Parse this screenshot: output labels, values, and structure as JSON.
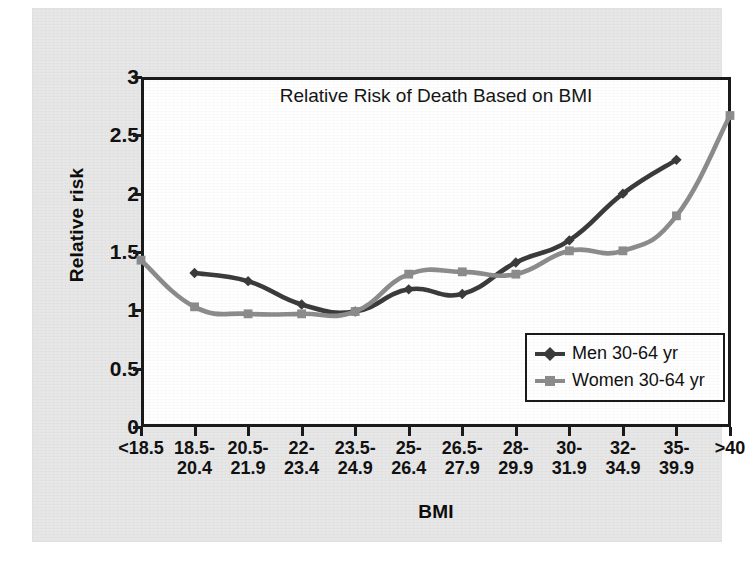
{
  "chart_data": {
    "type": "line",
    "title": "Relative Risk of Death Based on BMI",
    "xlabel": "BMI",
    "ylabel": "Relative risk",
    "categories": [
      "<18.5",
      "18.5-\n20.4",
      "20.5-\n21.9",
      "22-\n23.4",
      "23.5-\n24.9",
      "25-\n26.4",
      "26.5-\n27.9",
      "28-\n29.9",
      "30-\n31.9",
      "32-\n34.9",
      "35-\n39.9",
      ">40"
    ],
    "ylim": [
      0,
      3
    ],
    "yticks": [
      "0",
      "0.5",
      "1",
      "1.5",
      "2",
      "2.5",
      "3"
    ],
    "ytick_values": [
      0,
      0.5,
      1,
      1.5,
      2,
      2.5,
      3
    ],
    "grid": false,
    "legend_position": "lower-right",
    "series": [
      {
        "name": "Men 30-64 yr",
        "color": "#3b3b3b",
        "marker": "diamond",
        "values": [
          null,
          1.32,
          1.25,
          1.05,
          0.99,
          1.18,
          1.14,
          1.41,
          1.6,
          2.0,
          2.29,
          null
        ]
      },
      {
        "name": "Women 30-64 yr",
        "color": "#8c8c8c",
        "marker": "square",
        "values": [
          1.43,
          1.03,
          0.97,
          0.97,
          0.99,
          1.31,
          1.33,
          1.31,
          1.51,
          1.51,
          1.81,
          2.67
        ]
      }
    ]
  },
  "axis": {
    "y_title": "Relative risk",
    "x_title": "BMI"
  },
  "legend": {
    "items": [
      {
        "label": "Men 30-64 yr",
        "color": "#3b3b3b"
      },
      {
        "label": "Women 30-64 yr",
        "color": "#8c8c8c"
      }
    ]
  },
  "colors": {
    "men": "#3b3b3b",
    "women": "#8c8c8c",
    "axis": "#1a1a1a",
    "panel_background": "#e7e7e7",
    "plot_background": "#ffffff"
  }
}
